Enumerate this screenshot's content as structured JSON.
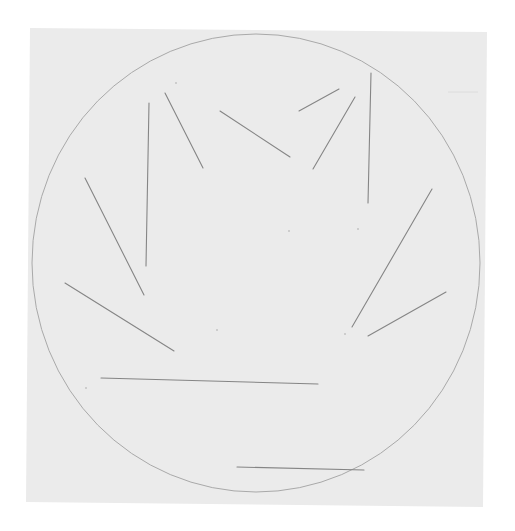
{
  "artwork": {
    "background_color": "#ffffff",
    "paper": {
      "color": "#ebebeb",
      "corners": [
        [
          30,
          28
        ],
        [
          487,
          32
        ],
        [
          483,
          507
        ],
        [
          26,
          502
        ]
      ]
    },
    "circle": {
      "cx": 256,
      "cy": 263,
      "rx": 224,
      "ry": 229,
      "stroke": "#a9a9a9"
    },
    "line_color": "#858585",
    "segments": [
      {
        "x1": 149,
        "y1": 103,
        "x2": 146,
        "y2": 266
      },
      {
        "x1": 165,
        "y1": 93,
        "x2": 203,
        "y2": 168
      },
      {
        "x1": 85,
        "y1": 178,
        "x2": 144,
        "y2": 295
      },
      {
        "x1": 220,
        "y1": 111,
        "x2": 290,
        "y2": 157
      },
      {
        "x1": 299,
        "y1": 111,
        "x2": 339,
        "y2": 89
      },
      {
        "x1": 313,
        "y1": 169,
        "x2": 355,
        "y2": 97
      },
      {
        "x1": 371,
        "y1": 73,
        "x2": 368,
        "y2": 203
      },
      {
        "x1": 432,
        "y1": 189,
        "x2": 352,
        "y2": 327
      },
      {
        "x1": 446,
        "y1": 292,
        "x2": 368,
        "y2": 336
      },
      {
        "x1": 65,
        "y1": 283,
        "x2": 174,
        "y2": 351
      },
      {
        "x1": 101,
        "y1": 378,
        "x2": 318,
        "y2": 384
      },
      {
        "x1": 237,
        "y1": 467,
        "x2": 364,
        "y2": 470
      }
    ],
    "faint_marks": [
      {
        "x1": 448,
        "y1": 92,
        "x2": 478,
        "y2": 92
      }
    ],
    "specks": [
      {
        "x": 176,
        "y": 83
      },
      {
        "x": 358,
        "y": 229
      },
      {
        "x": 345,
        "y": 334
      },
      {
        "x": 217,
        "y": 330
      },
      {
        "x": 289,
        "y": 231
      },
      {
        "x": 86,
        "y": 388
      }
    ]
  }
}
